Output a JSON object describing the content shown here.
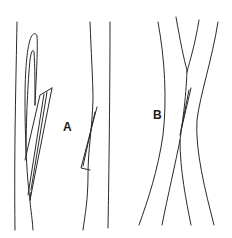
{
  "figure": {
    "panels": [
      {
        "id": "A",
        "label": "A",
        "description": "Fibers with longitudinal splits"
      },
      {
        "id": "B",
        "label": "B",
        "description": "Crossing fibers with small split"
      }
    ],
    "line_color": "#2a2a2a",
    "background": "#ffffff"
  }
}
